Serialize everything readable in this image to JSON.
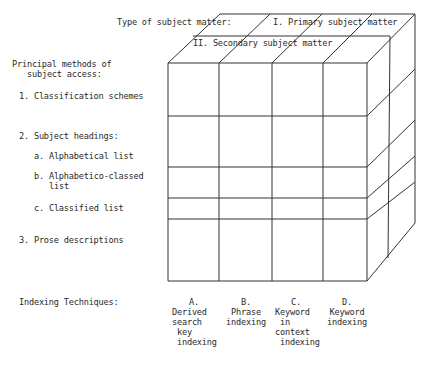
{
  "diagram": {
    "dimension_axis_label": "Type of subject matter:",
    "subject_matter_types": [
      {
        "id": "I",
        "label": "I. Primary subject matter"
      },
      {
        "id": "II",
        "label": "II. Secondary subject matter"
      }
    ],
    "rows_heading": {
      "line1": "Principal methods of",
      "line2": "subject access:"
    },
    "rows": [
      {
        "label": "1. Classification schemes"
      },
      {
        "label": "2. Subject headings:"
      },
      {
        "label": "a. Alphabetical list"
      },
      {
        "label": "b. Alphabetico-classed",
        "label_cont": "list"
      },
      {
        "label": "c. Classified list"
      },
      {
        "label": "3. Prose descriptions"
      }
    ],
    "columns_heading": "Indexing Techniques:",
    "columns": [
      {
        "letter": "A.",
        "text": "Derived\nsearch\n key\n indexing"
      },
      {
        "letter": "B.",
        "text": "Phrase\nindexing"
      },
      {
        "letter": "C.",
        "text": "Keyword\n in\ncontext\n indexing"
      },
      {
        "letter": "D.",
        "text": "Keyword\nindexing"
      }
    ],
    "line_color": "#333333"
  }
}
